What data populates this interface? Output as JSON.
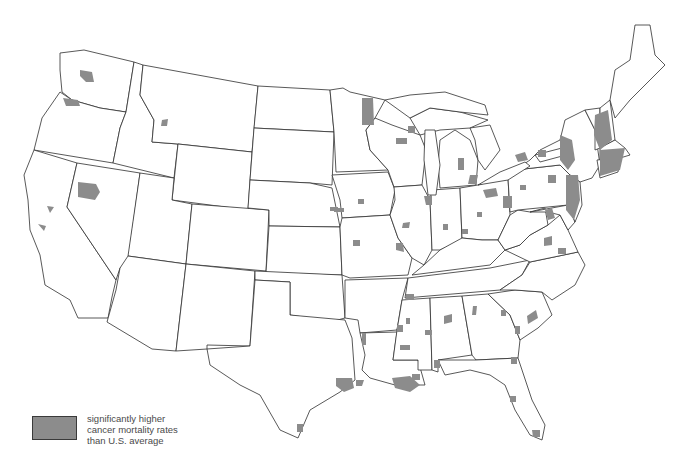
{
  "map": {
    "subject": "Contiguous United States",
    "fill_color": "#8c8c8c",
    "outline_color": "#2f2f2f",
    "background": "#ffffff"
  },
  "legend": {
    "swatch_color": "#8c8c8c",
    "lines": [
      "significantly higher",
      "cancer mortality rates",
      "than U.S. average"
    ]
  }
}
